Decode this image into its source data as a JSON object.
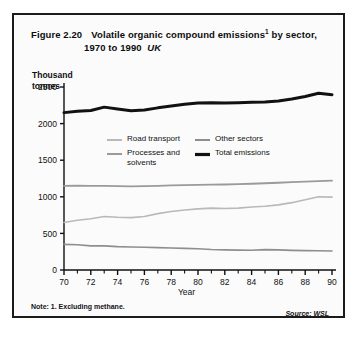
{
  "figure": {
    "number": "Figure 2.20",
    "title_line1_main": "Volatile organic compound emissions",
    "title_footnote_marker": "1",
    "title_line1_tail": "by sector,",
    "title_line2": "1970 to 1990",
    "title_region": "UK",
    "note": "Note: 1.  Excluding methane.",
    "source": "Source: WSL"
  },
  "chart_data": {
    "type": "line",
    "xlabel": "Year",
    "ylabel": "Thousand\ntonnes",
    "ylim": [
      0,
      2500
    ],
    "xlim": [
      70,
      90
    ],
    "yticks": [
      0,
      500,
      1000,
      1500,
      2000,
      2500
    ],
    "ytick_labels": [
      "0",
      "500",
      "1000",
      "1500",
      "2000",
      "2500"
    ],
    "xticks": [
      70,
      72,
      74,
      76,
      78,
      80,
      82,
      84,
      86,
      88,
      90
    ],
    "xtick_labels": [
      "70",
      "72",
      "74",
      "76",
      "78",
      "80",
      "82",
      "84",
      "86",
      "88",
      "90"
    ],
    "x_minor_ticks": [
      71,
      73,
      75,
      77,
      79,
      81,
      83,
      85,
      87,
      89
    ],
    "grid": false,
    "legend_position": "inside-upper-centre",
    "x": [
      70,
      71,
      72,
      73,
      74,
      75,
      76,
      77,
      78,
      79,
      80,
      81,
      82,
      83,
      84,
      85,
      86,
      87,
      88,
      89,
      90
    ],
    "series": [
      {
        "name": "Road transport",
        "color": "#b9b9b9",
        "width": 1.6,
        "values": [
          650,
          680,
          700,
          730,
          720,
          715,
          730,
          770,
          800,
          820,
          835,
          845,
          840,
          845,
          860,
          870,
          890,
          920,
          960,
          1000,
          995
        ]
      },
      {
        "name": "Other sectors",
        "color": "#8e8e8e",
        "width": 1.6,
        "values": [
          350,
          345,
          330,
          330,
          320,
          315,
          310,
          305,
          300,
          295,
          290,
          280,
          275,
          272,
          270,
          278,
          275,
          268,
          265,
          262,
          260
        ]
      },
      {
        "name": "Processes and\nsolvents",
        "color": "#9a9a9a",
        "width": 1.8,
        "values": [
          1150,
          1152,
          1150,
          1148,
          1145,
          1143,
          1145,
          1150,
          1155,
          1160,
          1162,
          1165,
          1168,
          1172,
          1178,
          1185,
          1192,
          1200,
          1208,
          1215,
          1220
        ]
      },
      {
        "name": "Total emissions",
        "color": "#111111",
        "width": 3.0,
        "values": [
          2150,
          2170,
          2180,
          2225,
          2200,
          2175,
          2185,
          2215,
          2240,
          2265,
          2280,
          2285,
          2282,
          2284,
          2290,
          2295,
          2310,
          2335,
          2370,
          2415,
          2395
        ]
      }
    ]
  }
}
